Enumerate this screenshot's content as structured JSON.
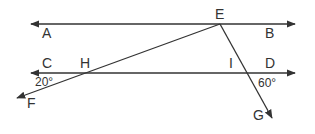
{
  "diagram": {
    "type": "geometry",
    "colors": {
      "stroke": "#333333",
      "background": "#ffffff"
    },
    "points": {
      "A": "A",
      "B": "B",
      "C": "C",
      "D": "D",
      "E": "E",
      "F": "F",
      "G": "G",
      "H": "H",
      "I": "I"
    },
    "angles": {
      "angle_at_H": "20°",
      "angle_at_I": "60°"
    },
    "lines": [
      {
        "name": "AB",
        "arrows": "both"
      },
      {
        "name": "CD",
        "arrows": "both"
      },
      {
        "name": "EF",
        "through": "H",
        "arrow": "F"
      },
      {
        "name": "EG",
        "through": "I",
        "arrow": "G"
      }
    ]
  }
}
